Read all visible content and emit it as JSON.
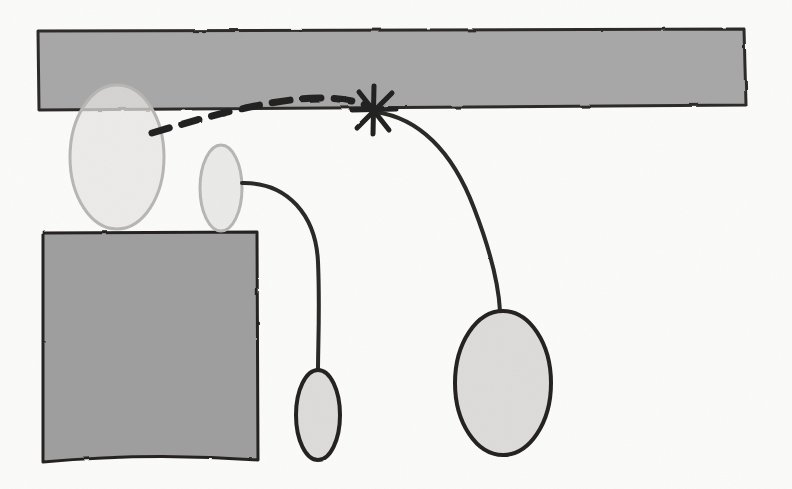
{
  "figure": {
    "medium": "pencil and ink on paper, scanned",
    "canvas": {
      "width": 792,
      "height": 489
    },
    "colors": {
      "paper": "#fbfbfa",
      "bar_fill": "#a8a8a8",
      "bar_stroke": "#2e2c2b",
      "block_fill": "#9f9f9f",
      "block_stroke": "#262422",
      "pale_fill": "#e6e5e3",
      "pale_stroke_light": "#b9b7b4",
      "dark_stroke": "#2b2927",
      "ghost_text": "#d9d7d4"
    },
    "shapes": [
      {
        "id": "horizontal-bar",
        "name": "horizontal-bar",
        "kind": "filled-band",
        "label": "long horizontal gray band across the top",
        "bounds": {
          "x": 37,
          "y": 30,
          "width": 708,
          "height": 79
        },
        "fill": "#a8a8a8",
        "stroke": "#2e2c2b",
        "stroke_width": 3
      },
      {
        "id": "lower-block",
        "name": "lower-left-block",
        "kind": "filled-rect",
        "label": "gray rectangular block at lower left",
        "bounds": {
          "x": 42,
          "y": 232,
          "width": 216,
          "height": 230
        },
        "fill": "#9f9f9f",
        "stroke": "#262422",
        "stroke_width": 3
      },
      {
        "id": "ellipse-large-left",
        "name": "ellipse-large-left",
        "kind": "ellipse",
        "label": "large pale egg-shaped outline overlapping the bar",
        "center": {
          "x": 117,
          "y": 157
        },
        "radii": {
          "rx": 47,
          "ry": 72
        },
        "fill": "#e6e5e3",
        "stroke": "#b9b7b4",
        "stroke_width": 3
      },
      {
        "id": "ellipse-medium",
        "name": "ellipse-medium-center",
        "kind": "ellipse",
        "label": "medium pale ellipse standing on the block",
        "center": {
          "x": 221,
          "y": 188
        },
        "radii": {
          "rx": 21,
          "ry": 43
        },
        "fill": "#e6e5e3",
        "stroke": "#b9b7b4",
        "stroke_width": 3
      },
      {
        "id": "ellipse-small",
        "name": "ellipse-small-lower",
        "kind": "ellipse",
        "label": "small dark-outlined ellipse at the end of the short curve",
        "center": {
          "x": 318,
          "y": 415
        },
        "radii": {
          "rx": 22,
          "ry": 45
        },
        "fill": "#dedcda",
        "stroke": "#262422",
        "stroke_width": 4
      },
      {
        "id": "ellipse-large-right",
        "name": "ellipse-large-right",
        "kind": "ellipse",
        "label": "large dark-outlined ellipse at the end of the long curve",
        "center": {
          "x": 503,
          "y": 383
        },
        "radii": {
          "rx": 48,
          "ry": 72
        },
        "fill": "#dedcda",
        "stroke": "#262422",
        "stroke_width": 4
      }
    ],
    "strokes": [
      {
        "id": "curve-short",
        "name": "curve-short-to-small-ellipse",
        "kind": "curve",
        "label": "short solid curve from the medium ellipse down to the small ellipse",
        "from": "ellipse-medium-center",
        "to": "ellipse-small-lower",
        "path": "M 242 183 C 288 182 316 216 318 262 C 320 308 318 344 318 371",
        "stroke": "#2b2927",
        "stroke_width": 4,
        "dashed": false
      },
      {
        "id": "curve-long",
        "name": "curve-long-to-large-ellipse",
        "kind": "curve",
        "label": "long solid curve from the X mark sweeping down to the large right ellipse",
        "from": "x-mark",
        "to": "ellipse-large-right",
        "path": "M 376 112 C 418 118 452 150 474 208 C 494 260 499 292 500 311",
        "stroke": "#2b2927",
        "stroke_width": 4,
        "dashed": false
      },
      {
        "id": "curve-dashed",
        "name": "curve-dashed-trajectory",
        "kind": "curve",
        "label": "dashed arc running from the left ellipse up and right to the X mark",
        "from": "ellipse-large-left",
        "to": "x-mark",
        "path": "M 152 133 C 196 120 250 104 300 99 C 330 96 356 100 370 107",
        "stroke": "#232120",
        "stroke_width": 7,
        "dashed": true,
        "dash_pattern": "18 13"
      }
    ],
    "marks": [
      {
        "id": "x-mark",
        "name": "x-mark",
        "kind": "asterisk-cross",
        "label": "hand-drawn X / asterisk marking the junction on the bar edge",
        "center": {
          "x": 375,
          "y": 111
        },
        "arm_length": 24,
        "arms": 6,
        "stroke": "#232120",
        "stroke_width": 5
      }
    ],
    "ghost_text": {
      "label": "faint show-through text from the reverse side of the page",
      "lines": [
        {
          "text": "the equation of the radius",
          "x": 150,
          "y": 8,
          "size": 15
        },
        {
          "text": "by yields",
          "x": 600,
          "y": 6,
          "size": 15
        },
        {
          "text": "mon",
          "x": 300,
          "y": 150,
          "size": 17
        },
        {
          "text": "either",
          "x": 430,
          "y": 150,
          "size": 17
        },
        {
          "text": "equation",
          "x": 330,
          "y": 178,
          "size": 17
        },
        {
          "text": "for all",
          "x": 520,
          "y": 176,
          "size": 16
        },
        {
          "text": "given",
          "x": 360,
          "y": 205,
          "size": 17
        },
        {
          "text": "case",
          "x": 560,
          "y": 205,
          "size": 16
        },
        {
          "text": "to",
          "x": 350,
          "y": 262,
          "size": 16
        },
        {
          "text": "equation",
          "x": 470,
          "y": 260,
          "size": 17
        },
        {
          "text": "the",
          "x": 330,
          "y": 290,
          "size": 16
        },
        {
          "text": "data",
          "x": 470,
          "y": 288,
          "size": 16
        },
        {
          "text": "the",
          "x": 620,
          "y": 290,
          "size": 16
        },
        {
          "text": "figure",
          "x": 350,
          "y": 318,
          "size": 16
        },
        {
          "text": "variable",
          "x": 500,
          "y": 316,
          "size": 16
        },
        {
          "text": "W",
          "x": 640,
          "y": 316,
          "size": 16
        }
      ]
    }
  }
}
